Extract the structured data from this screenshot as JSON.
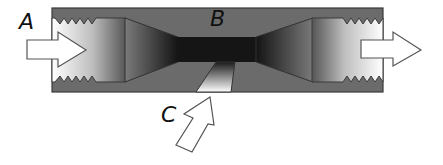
{
  "diagram": {
    "type": "venturi-injector-cross-section",
    "labels": {
      "a": "A",
      "b": "B",
      "c": "C"
    },
    "components": {
      "body": "venturi-body",
      "inlet": "threaded-inlet",
      "outlet": "threaded-outlet",
      "throat": "constriction-throat",
      "suction_port": "side-suction-port"
    },
    "arrows": {
      "inlet_arrow": "flow-in",
      "outlet_arrow": "flow-out",
      "suction_arrow": "suction-in"
    }
  },
  "colors": {
    "body_fill": "#6b6b6b",
    "body_outline": "#3a3a3a",
    "throat_dark": "#151515",
    "passage_light": "#ffffff",
    "arrow_fill": "#ffffff",
    "arrow_stroke": "#555555",
    "label_color": "#111111"
  }
}
